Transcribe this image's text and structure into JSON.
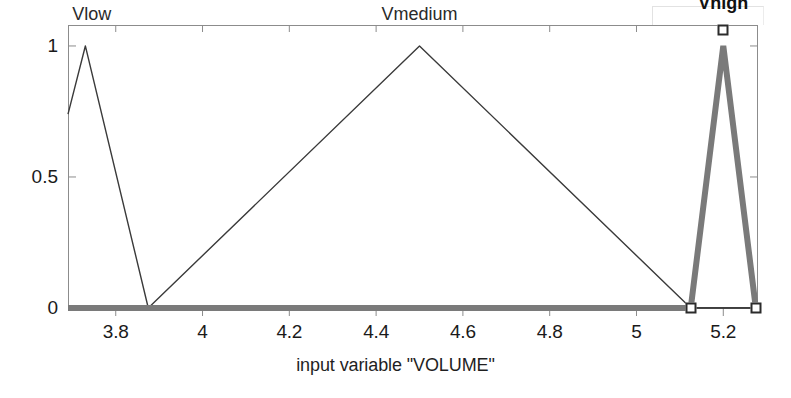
{
  "axes": {
    "xlabel": "input variable \"VOLUME\"",
    "ylabel": "",
    "xticks": [
      "3.8",
      "4",
      "4.2",
      "4.4",
      "4.6",
      "4.8",
      "5",
      "5.2"
    ],
    "yticks": [
      "0",
      "0.5",
      "1"
    ]
  },
  "labels": {
    "vlow": "Vlow",
    "vmedium": "Vmedium",
    "vhigh": "Vhigh"
  },
  "colors": {
    "unselected_curve": "#3a3a3a",
    "selected_curve": "#7a7a7a",
    "frame": "#8c8c8c",
    "text": "#1a1a1a",
    "background": "#ffffff"
  },
  "chart_data": {
    "type": "line",
    "title": "",
    "subtitle": "",
    "xlabel": "input variable \"VOLUME\"",
    "ylabel": "",
    "xlim": [
      3.69,
      5.28
    ],
    "ylim": [
      0,
      1.08
    ],
    "xticks": [
      3.8,
      4,
      4.2,
      4.4,
      4.6,
      4.8,
      5,
      5.2
    ],
    "yticks": [
      0,
      0.5,
      1
    ],
    "grid": false,
    "legend_position": "inline-labels-above-peaks",
    "series": [
      {
        "name": "Vlow",
        "selected": false,
        "style": "thin-dark",
        "shape": "triangular",
        "params": [
          3.58,
          3.73,
          3.875
        ],
        "x": [
          3.69,
          3.73,
          3.875,
          5.28
        ],
        "values": [
          0.74,
          1.0,
          0.0,
          0.0
        ],
        "label_x": 3.745,
        "label_y": 1.12
      },
      {
        "name": "Vmedium",
        "selected": false,
        "style": "thin-dark",
        "shape": "triangular",
        "params": [
          3.875,
          4.5,
          5.125
        ],
        "x": [
          3.69,
          3.875,
          4.5,
          5.125,
          5.28
        ],
        "values": [
          0.0,
          0.0,
          1.0,
          0.0,
          0.0
        ],
        "label_x": 4.5,
        "label_y": 1.12
      },
      {
        "name": "Vhigh",
        "selected": true,
        "style": "thick-gray",
        "shape": "triangular",
        "params": [
          5.125,
          5.2,
          5.275
        ],
        "x": [
          3.69,
          5.125,
          5.2,
          5.275,
          5.28
        ],
        "values": [
          0.0,
          0.0,
          1.0,
          0.0,
          0.0
        ],
        "label_x": 5.2,
        "label_y": 1.16,
        "handles": [
          {
            "x": 5.125,
            "y": 0.0,
            "name": "left-base-handle"
          },
          {
            "x": 5.2,
            "y": 1.06,
            "name": "peak-handle"
          },
          {
            "x": 5.275,
            "y": 0.0,
            "name": "right-base-handle"
          }
        ]
      }
    ]
  }
}
